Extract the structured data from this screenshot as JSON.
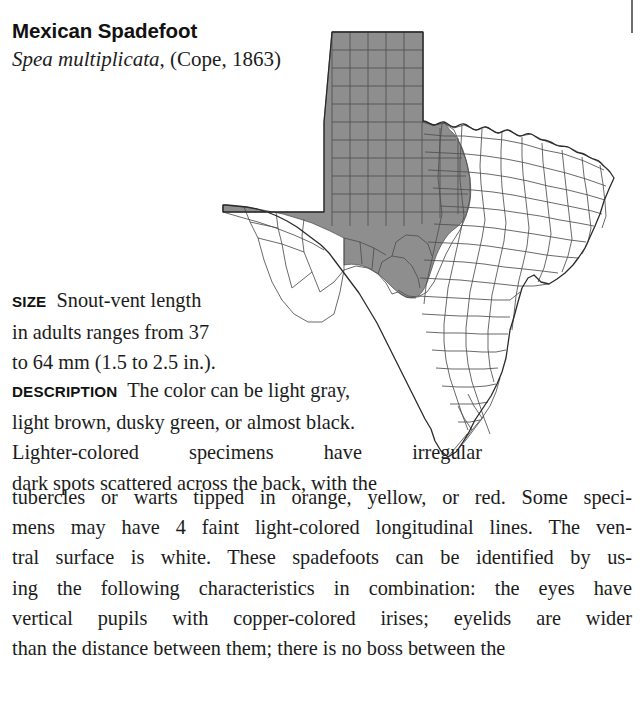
{
  "page": {
    "background": "#ffffff",
    "width": 643,
    "height": 704
  },
  "heading": {
    "common_name": "Mexican Spadefoot",
    "scientific_name": "Spea multiplicata",
    "authority": ", (Cope, 1863)"
  },
  "sections": {
    "size": {
      "label": "SIZE",
      "lines": [
        "Snout-vent length",
        "in adults ranges from 37",
        "to 64 mm (1.5 to 2.5 in.)."
      ],
      "text": "Snout-vent length in adults ranges from 37 to 64 mm (1.5 to 2.5 in.)."
    },
    "description": {
      "label": "DESCRIPTION",
      "narrow_lines": [
        "The color can be light gray,",
        "light brown, dusky green, or almost black.",
        "Lighter-colored specimens have irregular",
        "dark spots scattered across the back, with the"
      ],
      "wide_lines": [
        "tubercles or warts tipped in orange, yellow, or red. Some speci-",
        "mens may have 4 faint light-colored longitudinal lines. The ven-",
        "tral surface is white. These spadefoots can be identified by us-",
        "ing the following characteristics in combination: the eyes have",
        "vertical pupils with copper-colored irises; eyelids are wider",
        "than the distance between them; there is no boss between the"
      ],
      "text": "The color can be light gray, light brown, dusky green, or almost black. Lighter-colored specimens have irregular dark spots scattered across the back, with the tubercles or warts tipped in orange, yellow, or red. Some specimens may have 4 faint light-colored longitudinal lines. The ventral surface is white. These spadefoots can be identified by using the following characteristics in combination: the eyes have vertical pupils with copper-colored irises; eyelids are wider than the distance between them; there is no boss between the"
    }
  },
  "map": {
    "name": "texas-county-distribution-map",
    "state": "Texas",
    "shaded_region_description": "Panhandle, West Texas, and Trans-Pecos counties shaded gray indicating species range",
    "colors": {
      "range_fill": "#8e8e8e",
      "outside_fill": "#ffffff",
      "county_line": "#555555",
      "state_outline": "#2b2b2b",
      "range_edge": "#3a3a3a"
    }
  }
}
